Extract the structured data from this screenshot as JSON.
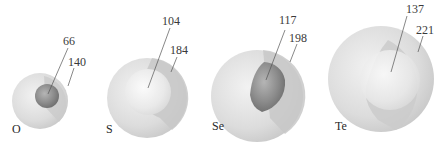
{
  "figure": {
    "elements": [
      {
        "symbol": "O",
        "atomic_radius": "66",
        "ionic_radius": "140"
      },
      {
        "symbol": "S",
        "atomic_radius": "104",
        "ionic_radius": "184"
      },
      {
        "symbol": "Se",
        "atomic_radius": "117",
        "ionic_radius": "198"
      },
      {
        "symbol": "Te",
        "atomic_radius": "137",
        "ionic_radius": "221"
      }
    ]
  },
  "colors": {
    "outer_sphere": "#d9d9d9",
    "shadow_band": "#c6c6c6",
    "dark_core": "#8a8a8a",
    "light_core": "#ececec",
    "text": "#3a3a3a"
  }
}
